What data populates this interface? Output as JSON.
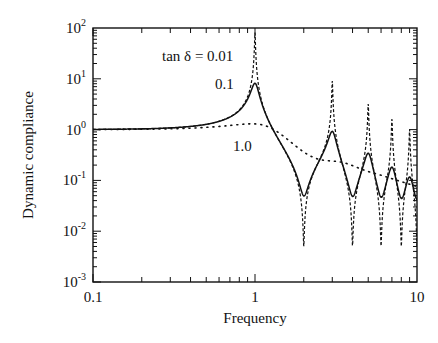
{
  "chart_data": {
    "type": "line",
    "title": "",
    "xlabel": "Frequency",
    "ylabel": "Dynamic compliance",
    "xscale": "log",
    "yscale": "log",
    "xlim": [
      0.1,
      10
    ],
    "ylim": [
      0.001,
      100
    ],
    "x_ticks": [
      {
        "value": 0.1,
        "label": "0.1"
      },
      {
        "value": 1,
        "label": "1"
      },
      {
        "value": 10,
        "label": "10"
      }
    ],
    "y_ticks": [
      {
        "value": 100,
        "base": "10",
        "exp": "2"
      },
      {
        "value": 10,
        "base": "10",
        "exp": "1"
      },
      {
        "value": 1,
        "base": "10",
        "exp": "0"
      },
      {
        "value": 0.1,
        "base": "10",
        "exp": "-1"
      },
      {
        "value": 0.01,
        "base": "10",
        "exp": "-2"
      },
      {
        "value": 0.001,
        "base": "10",
        "exp": "-3"
      }
    ],
    "grid": false,
    "legend": "inline annotations",
    "annotations": [
      {
        "text": "tan δ = 0.01",
        "series": "tan δ = 0.01"
      },
      {
        "text": "0.1",
        "series": "tan δ = 0.1"
      },
      {
        "text": "1.0",
        "series": "tan δ = 1.0"
      }
    ],
    "series": [
      {
        "name": "tan δ = 0.01",
        "style": "dashed",
        "loss_factor": 0.01,
        "key_points": [
          {
            "x": 0.1,
            "y": 1.0
          },
          {
            "x": 0.5,
            "y": 1.2
          },
          {
            "x": 1.0,
            "y": 100
          },
          {
            "x": 2.0,
            "y": 0.005
          },
          {
            "x": 3.0,
            "y": 25
          },
          {
            "x": 4.0,
            "y": 0.005
          },
          {
            "x": 5.0,
            "y": 8
          },
          {
            "x": 6.0,
            "y": 0.005
          },
          {
            "x": 7.0,
            "y": 6
          },
          {
            "x": 8.0,
            "y": 0.005
          },
          {
            "x": 9.0,
            "y": 3
          }
        ]
      },
      {
        "name": "tan δ = 0.1",
        "style": "solid",
        "loss_factor": 0.1,
        "key_points": [
          {
            "x": 0.1,
            "y": 1.0
          },
          {
            "x": 0.5,
            "y": 1.3
          },
          {
            "x": 0.8,
            "y": 2.5
          },
          {
            "x": 1.0,
            "y": 8
          },
          {
            "x": 1.5,
            "y": 0.5
          },
          {
            "x": 2.0,
            "y": 0.05
          },
          {
            "x": 3.0,
            "y": 0.9
          },
          {
            "x": 4.0,
            "y": 0.05
          },
          {
            "x": 5.0,
            "y": 0.32
          },
          {
            "x": 6.0,
            "y": 0.05
          },
          {
            "x": 7.0,
            "y": 0.17
          },
          {
            "x": 8.0,
            "y": 0.05
          },
          {
            "x": 9.0,
            "y": 0.1
          },
          {
            "x": 10.0,
            "y": 0.05
          }
        ]
      },
      {
        "name": "tan δ = 1.0",
        "style": "dotted",
        "loss_factor": 1.0,
        "key_points": [
          {
            "x": 0.1,
            "y": 1.4
          },
          {
            "x": 0.5,
            "y": 1.1
          },
          {
            "x": 1.0,
            "y": 0.85
          },
          {
            "x": 1.5,
            "y": 0.45
          },
          {
            "x": 2.0,
            "y": 0.3
          },
          {
            "x": 3.0,
            "y": 0.15
          },
          {
            "x": 5.0,
            "y": 0.08
          },
          {
            "x": 10.0,
            "y": 0.045
          }
        ]
      }
    ]
  }
}
